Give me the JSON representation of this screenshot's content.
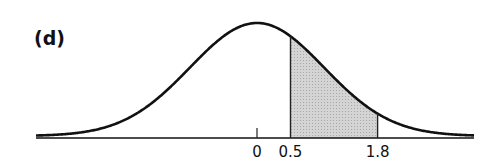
{
  "panel": {
    "label": "(d)"
  },
  "chart_data": {
    "type": "area",
    "title": "",
    "panel_label": "(d)",
    "xlabel": "",
    "ylabel": "",
    "distribution": "standard normal",
    "mean": 0,
    "shaded_region": {
      "from": 0.5,
      "to": 1.8,
      "fill": "#c8c8c8"
    },
    "tick_labels": [
      "0",
      "0.5",
      "1.8"
    ],
    "ticks": [
      0,
      0.5,
      1.8
    ],
    "xlim": [
      -3.3,
      3.3
    ],
    "grid": false,
    "legend": null
  },
  "colors": {
    "curve": "#111111",
    "shade": "#cfcfcf"
  }
}
